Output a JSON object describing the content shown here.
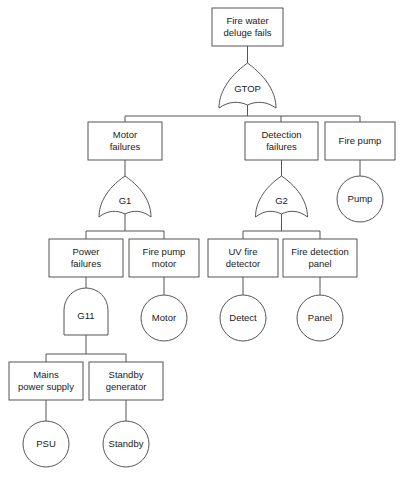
{
  "diagram": {
    "type": "fault-tree",
    "title": "Fire water deluge fails",
    "colors": {
      "stroke": "#555555",
      "fill": "#ffffff",
      "text": "#1a1a1a"
    },
    "nodes": {
      "top_event": {
        "label_line1": "Fire water",
        "label_line2": "deluge fails"
      },
      "gate_top": {
        "label": "GTOP",
        "type": "or"
      },
      "motor_failures": {
        "label_line1": "Motor",
        "label_line2": "failures"
      },
      "detection_failures": {
        "label_line1": "Detection",
        "label_line2": "failures"
      },
      "fire_pump": {
        "label_line1": "Fire pump",
        "label_line2": ""
      },
      "gate_g1": {
        "label": "G1",
        "type": "or"
      },
      "gate_g2": {
        "label": "G2",
        "type": "or"
      },
      "event_pump": {
        "label": "Pump"
      },
      "power_failures": {
        "label_line1": "Power",
        "label_line2": "failures"
      },
      "fire_pump_motor": {
        "label_line1": "Fire pump",
        "label_line2": "motor"
      },
      "uv_fire_detector": {
        "label_line1": "UV fire",
        "label_line2": "detector"
      },
      "fire_detection_panel": {
        "label_line1": "Fire detection",
        "label_line2": "panel"
      },
      "gate_g11": {
        "label": "G11",
        "type": "and"
      },
      "event_motor": {
        "label": "Motor"
      },
      "event_detect": {
        "label": "Detect"
      },
      "event_panel": {
        "label": "Panel"
      },
      "mains_power_supply": {
        "label_line1": "Mains",
        "label_line2": "power supply"
      },
      "standby_generator": {
        "label_line1": "Standby",
        "label_line2": "generator"
      },
      "event_psu": {
        "label": "PSU"
      },
      "event_standby": {
        "label": "Standby"
      }
    }
  }
}
